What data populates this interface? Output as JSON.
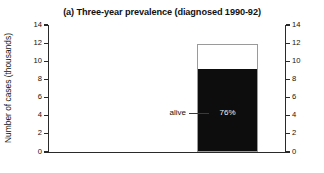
{
  "chart_data": {
    "type": "bar",
    "title": "(a) Three-year prevalence (diagnosed 1990-92)",
    "xlabel": "",
    "ylabel": "Number of cases (thousands)",
    "ylim": [
      0,
      14
    ],
    "yticks": [
      0,
      2,
      4,
      6,
      8,
      10,
      12,
      14
    ],
    "ytick_labels": [
      "0",
      "2",
      "4",
      "6",
      "8",
      "10",
      "12",
      "14"
    ],
    "grid": false,
    "legend": "none",
    "secondary_y_axis": {
      "ylim": [
        0,
        14
      ],
      "yticks": [
        0,
        2,
        4,
        6,
        8,
        10,
        12,
        14
      ],
      "ytick_labels": [
        "0",
        "2",
        "4",
        "6",
        "8",
        "10",
        "12",
        "14"
      ]
    },
    "categories": [
      ""
    ],
    "series": [
      {
        "name": "alive",
        "values": [
          9.0
        ],
        "color": "#0d0d0d"
      },
      {
        "name": "not alive",
        "values": [
          2.9
        ],
        "color": "#ffffff"
      }
    ],
    "total_value": 11.9,
    "annotations": [
      {
        "name": "alive",
        "text": "alive",
        "target_value": 4.3,
        "has_leader_line": true
      },
      {
        "name": "percent",
        "text": "76%",
        "target_value": 4.3
      }
    ]
  },
  "axis": {
    "ticks": [
      {
        "label": "14",
        "value": 14
      },
      {
        "label": "12",
        "value": 12
      },
      {
        "label": "10",
        "value": 10
      },
      {
        "label": "8",
        "value": 8
      },
      {
        "label": "6",
        "value": 6
      },
      {
        "label": "4",
        "value": 4
      },
      {
        "label": "2",
        "value": 2
      },
      {
        "label": "0",
        "value": 0
      }
    ]
  },
  "colors": {
    "background": "#ffffff",
    "axis": "#2a2a2a",
    "bar_fill": "#0d0d0d",
    "bar_outline": "#9a9a9a",
    "text": "#111111"
  }
}
